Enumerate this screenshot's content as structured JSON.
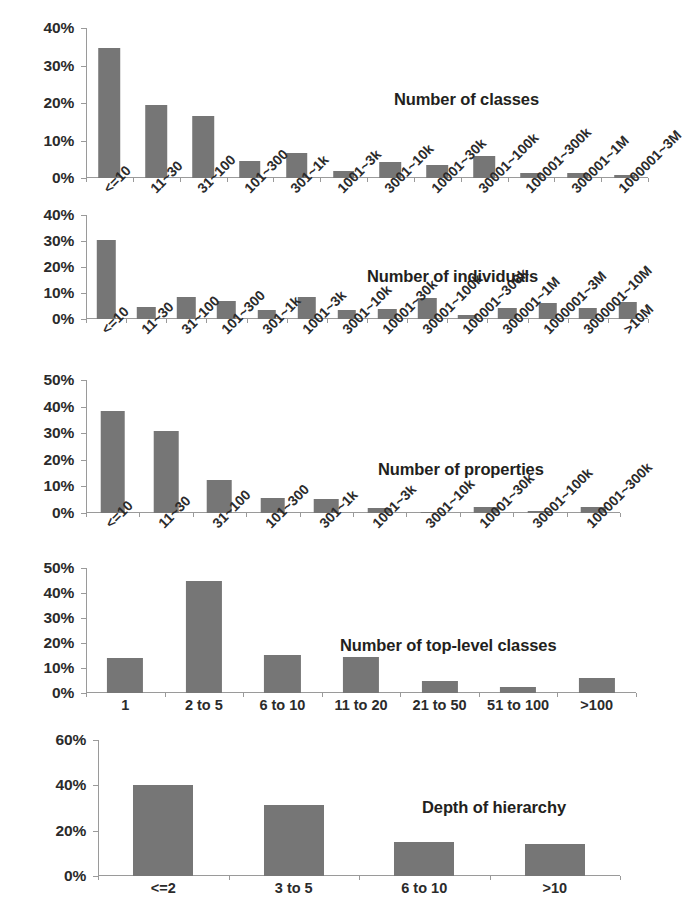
{
  "figure": {
    "background": "#ffffff",
    "bar_color": "#767676",
    "axis_color": "#9a9a9a",
    "text_color": "#231f20"
  },
  "chart_data": [
    {
      "id": "number-of-classes",
      "type": "bar",
      "title": "Number of classes",
      "xlabel": "",
      "ylabel": "",
      "ylim": [
        0,
        40
      ],
      "yticks": [
        "0%",
        "10%",
        "20%",
        "30%",
        "40%"
      ],
      "ytick_values": [
        0,
        10,
        20,
        30,
        40
      ],
      "grid": false,
      "legend": "none",
      "label_rotation": -45,
      "categories": [
        "<=10",
        "11~30",
        "31~100",
        "101~300",
        "301~1k",
        "1001~3k",
        "3001~10k",
        "10001~30k",
        "30001~100k",
        "100001~300k",
        "300001~1M",
        "1000001~3M"
      ],
      "values": [
        34.7,
        19.4,
        16.6,
        4.6,
        6.8,
        1.8,
        4.2,
        3.6,
        6.0,
        1.4,
        1.4,
        0.9
      ]
    },
    {
      "id": "number-of-individuals",
      "type": "bar",
      "title": "Number of individuals",
      "xlabel": "",
      "ylabel": "",
      "ylim": [
        0,
        40
      ],
      "yticks": [
        "0%",
        "10%",
        "20%",
        "30%",
        "40%"
      ],
      "ytick_values": [
        0,
        10,
        20,
        30,
        40
      ],
      "grid": false,
      "legend": "none",
      "label_rotation": -45,
      "categories": [
        "<=10",
        "11~30",
        "31~100",
        "101~300",
        "301~1k",
        "1001~3k",
        "3001~10k",
        "10001~30k",
        "30001~100k",
        "100001~300k",
        "300001~1M",
        "1000001~3M",
        "3000001~10M",
        ">10M"
      ],
      "values": [
        30.4,
        4.6,
        8.5,
        6.8,
        3.6,
        8.4,
        3.3,
        3.7,
        8.0,
        1.4,
        4.3,
        6.0,
        4.2,
        6.4
      ]
    },
    {
      "id": "number-of-properties",
      "type": "bar",
      "title": "Number of properties",
      "xlabel": "",
      "ylabel": "",
      "ylim": [
        0,
        50
      ],
      "yticks": [
        "0%",
        "10%",
        "20%",
        "30%",
        "40%",
        "50%"
      ],
      "ytick_values": [
        0,
        10,
        20,
        30,
        40,
        50
      ],
      "grid": false,
      "legend": "none",
      "label_rotation": -45,
      "categories": [
        "<=10",
        "11~30",
        "31~100",
        "101~300",
        "301~1k",
        "1001~3k",
        "3001~10k",
        "10001~30k",
        "30001~100k",
        "100001~300k"
      ],
      "values": [
        38.2,
        30.8,
        12.5,
        5.6,
        5.3,
        1.9,
        0.4,
        2.3,
        0.7,
        2.2
      ]
    },
    {
      "id": "number-of-top-level-classes",
      "type": "bar",
      "title": "Number of top-level classes",
      "xlabel": "",
      "ylabel": "",
      "ylim": [
        0,
        50
      ],
      "yticks": [
        "0%",
        "10%",
        "20%",
        "30%",
        "40%",
        "50%"
      ],
      "ytick_values": [
        0,
        10,
        20,
        30,
        40,
        50
      ],
      "grid": false,
      "legend": "none",
      "label_rotation": 0,
      "categories": [
        "1",
        "2 to 5",
        "6 to 10",
        "11 to 20",
        "21 to 50",
        "51 to 100",
        ">100"
      ],
      "values": [
        14.2,
        45.0,
        15.3,
        14.4,
        5.0,
        2.6,
        6.0
      ]
    },
    {
      "id": "depth-of-hierarchy",
      "type": "bar",
      "title": "Depth of hierarchy",
      "xlabel": "",
      "ylabel": "",
      "ylim": [
        0,
        60
      ],
      "yticks": [
        "0%",
        "20%",
        "40%",
        "60%"
      ],
      "ytick_values": [
        0,
        20,
        40,
        60
      ],
      "grid": false,
      "legend": "none",
      "label_rotation": 0,
      "categories": [
        "<=2",
        "3 to 5",
        "6 to 10",
        ">10"
      ],
      "values": [
        40.2,
        31.2,
        15.1,
        14.3
      ]
    }
  ]
}
